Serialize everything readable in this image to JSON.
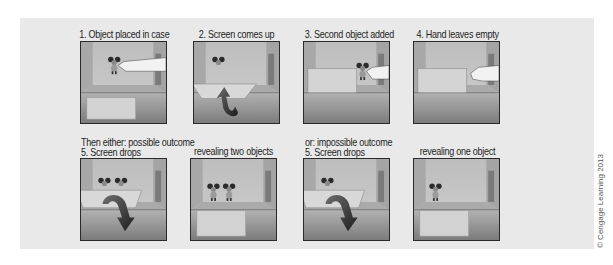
{
  "figure": {
    "row1": [
      {
        "caption": "1. Object placed in case",
        "scene": "hand-places-object"
      },
      {
        "caption": "2. Screen comes up",
        "scene": "screen-rises"
      },
      {
        "caption": "3. Second object added",
        "scene": "hand-adds-second-object"
      },
      {
        "caption": "4. Hand leaves empty",
        "scene": "hand-leaves-empty"
      }
    ],
    "row2": [
      {
        "caption_line1": "Then either: possible outcome",
        "caption_line2": "5. Screen drops",
        "scene": "screen-drops-two"
      },
      {
        "caption": "revealing two objects",
        "scene": "reveal-two-objects"
      },
      {
        "caption_line1": "or: impossible outcome",
        "caption_line2": "5. Screen drops",
        "scene": "screen-drops-one"
      },
      {
        "caption": "revealing one object",
        "scene": "reveal-one-object"
      }
    ],
    "copyright": "© Cengage Learning 2013"
  },
  "colors": {
    "background": "#e9e9e9",
    "panel_border": "#2a2a2a",
    "arrow": "#4a4a4a",
    "screen": "#d6d6d6"
  }
}
